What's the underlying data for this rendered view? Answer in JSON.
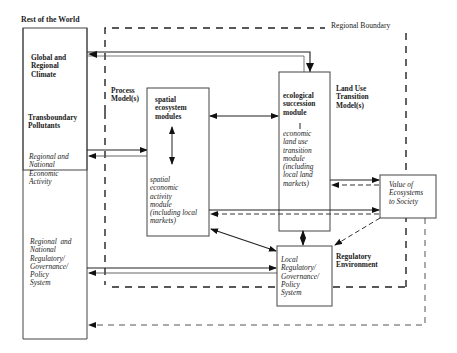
{
  "diagram": {
    "outer_label": "Rest of the World",
    "regional_boundary_label": "Regional Boundary",
    "rest_of_world": {
      "global_climate": "Global and\nRegional\nClimate",
      "transboundary": "Transboundary\nPollutants",
      "economic": "Regional and\nNational\nEconomic\nActivity",
      "regulatory": "Regional  and\nNational\nRegulatory/\nGovernance/\nPolicy\nSystem"
    },
    "process_models_label": "Process\nModel(s)",
    "spatial_box": {
      "title": "spatial\necosystem\nmodules",
      "body": "spatial\neconomic\nactivity\nmodule\n(including local\nmarkets)"
    },
    "land_use_label": "Land Use\nTransition\nModel(s)",
    "ecological_box": {
      "title": "ecological\nsuccession\nmodule",
      "body": "economic\nland use\ntransition\nmodule\n(including\nlocal land\nmarkets)"
    },
    "value_box": "Value of\nEcosystems\nto Society",
    "regulatory_env_label": "Regulatory\nEnvironment",
    "local_reg_box": "Local\nRegulatory/\nGovernance/\nPolicy\nSystem"
  }
}
